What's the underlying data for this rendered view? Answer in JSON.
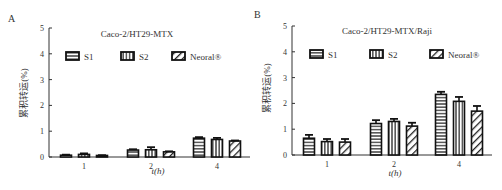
{
  "chart_data": [
    {
      "panel_label": "A",
      "type": "bar",
      "title": "Caco-2/HT29-MTX",
      "xlabel": "t(h)",
      "ylabel": "累积转运(%)",
      "ylim": [
        0,
        5
      ],
      "yticks": [
        "0",
        "1",
        "2",
        "3",
        "4",
        "5"
      ],
      "categories": [
        "1",
        "2",
        "4"
      ],
      "legend_position": "top",
      "series": [
        {
          "name": "S1",
          "pattern": "horizontal",
          "values": [
            0.07,
            0.27,
            0.73
          ],
          "err": [
            0.02,
            0.03,
            0.04
          ]
        },
        {
          "name": "S2",
          "pattern": "vertical",
          "values": [
            0.1,
            0.28,
            0.68
          ],
          "err": [
            0.04,
            0.1,
            0.06
          ]
        },
        {
          "name": "Neoral®",
          "pattern": "diagonal",
          "values": [
            0.06,
            0.2,
            0.62
          ],
          "err": [
            0.01,
            0.02,
            0.02
          ]
        }
      ]
    },
    {
      "panel_label": "B",
      "type": "bar",
      "title": "Caco-2/HT29-MTX/Raji",
      "xlabel": "t(h)",
      "ylabel": "累积转运(%)",
      "ylim": [
        0,
        5
      ],
      "yticks": [
        "0",
        "1",
        "2",
        "3",
        "4",
        "5"
      ],
      "categories": [
        "1",
        "2",
        "4"
      ],
      "legend_position": "top",
      "series": [
        {
          "name": "S1",
          "pattern": "horizontal",
          "values": [
            0.65,
            1.22,
            2.35
          ],
          "err": [
            0.13,
            0.13,
            0.1
          ]
        },
        {
          "name": "S2",
          "pattern": "vertical",
          "values": [
            0.52,
            1.3,
            2.08
          ],
          "err": [
            0.1,
            0.1,
            0.17
          ]
        },
        {
          "name": "Neoral®",
          "pattern": "diagonal",
          "values": [
            0.5,
            1.12,
            1.7
          ],
          "err": [
            0.12,
            0.13,
            0.2
          ]
        }
      ]
    }
  ]
}
